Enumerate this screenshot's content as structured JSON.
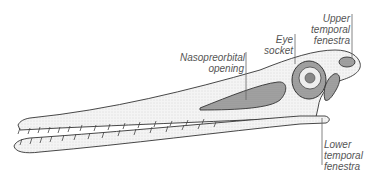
{
  "figure": {
    "labels": [
      {
        "id": "nasopreorbital",
        "lines": [
          "Nasopreorbital",
          "opening"
        ]
      },
      {
        "id": "eye",
        "lines": [
          "Eye",
          "socket"
        ]
      },
      {
        "id": "upper_temporal",
        "lines": [
          "Upper",
          "temporal",
          "fenestra"
        ]
      },
      {
        "id": "lower_temporal",
        "lines": [
          "Lower",
          "temporal",
          "fenestra"
        ]
      }
    ]
  },
  "colors": {
    "line": "#333333",
    "bone_fill": "#f2f2f2",
    "opening_fill": "#9a9a9a",
    "label_text": "#555555"
  }
}
